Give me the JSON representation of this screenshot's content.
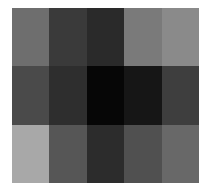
{
  "chart_data": {
    "type": "heatmap",
    "title": "",
    "xlabel": "",
    "ylabel": "",
    "rows": 3,
    "cols": 5,
    "colormap": "grayscale",
    "values": [
      [
        110,
        58,
        42,
        122,
        138
      ],
      [
        74,
        46,
        6,
        22,
        62
      ],
      [
        168,
        86,
        44,
        80,
        104
      ]
    ],
    "colors": [
      [
        "#6e6e6e",
        "#3a3a3a",
        "#2a2a2a",
        "#7a7a7a",
        "#8a8a8a"
      ],
      [
        "#4a4a4a",
        "#2e2e2e",
        "#060606",
        "#161616",
        "#3e3e3e"
      ],
      [
        "#a8a8a8",
        "#565656",
        "#2c2c2c",
        "#505050",
        "#686868"
      ]
    ],
    "grid": false,
    "legend": null
  }
}
